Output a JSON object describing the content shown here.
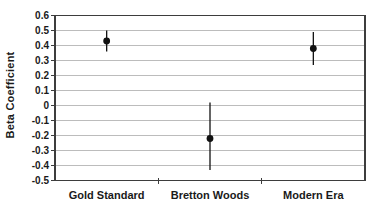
{
  "chart_data": {
    "type": "scatter",
    "subtype": "point-estimates-with-error-bars",
    "title": "",
    "xlabel": "",
    "ylabel": "Beta Coefficient",
    "categories": [
      "Gold Standard",
      "Bretton Woods",
      "Modern Era"
    ],
    "series": [
      {
        "name": "Beta coefficient point estimate",
        "values": [
          0.43,
          -0.22,
          0.38
        ],
        "ci_low": [
          0.36,
          -0.43,
          0.27
        ],
        "ci_high": [
          0.5,
          0.02,
          0.49
        ]
      }
    ],
    "ylim": [
      -0.5,
      0.6
    ],
    "ytick_values": [
      0.6,
      0.5,
      0.4,
      0.3,
      0.2,
      0.1,
      0,
      -0.1,
      -0.2,
      -0.3,
      -0.4,
      -0.5
    ],
    "ytick_labels": [
      "0.6",
      "0.5",
      "0.4",
      "0.3",
      "0.2",
      "0.1",
      "0",
      "-0.1",
      "-0.2",
      "-0.3",
      "-0.4",
      "-0.5"
    ],
    "grid": true,
    "legend": "none",
    "marker_color": "#111111",
    "gridline_color": "#bcbcbc",
    "frame_color": "#3d3d3d",
    "text_color": "#1a1a1a"
  }
}
